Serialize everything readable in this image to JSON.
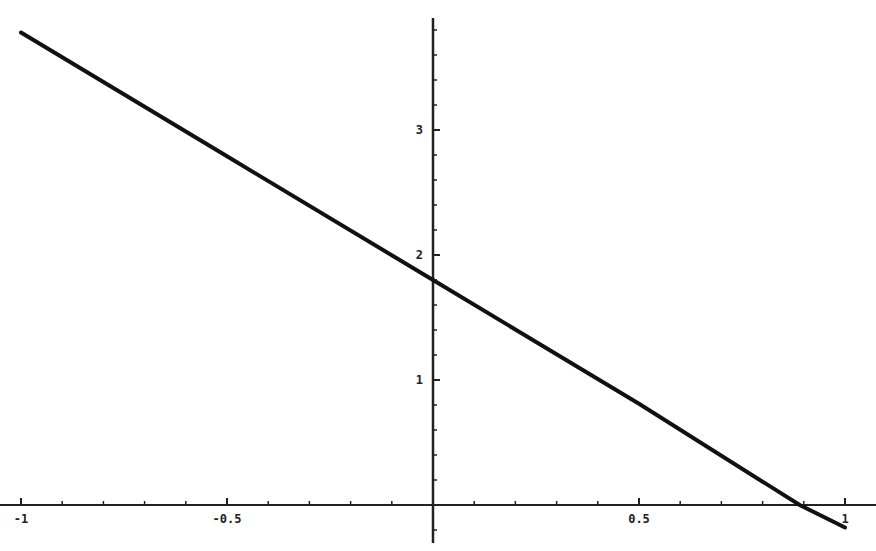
{
  "chart_data": {
    "type": "line",
    "title": "",
    "xlabel": "",
    "ylabel": "",
    "xlim": [
      -1.03,
      1.07
    ],
    "ylim": [
      -0.3,
      3.9
    ],
    "grid": false,
    "legend": null,
    "x_ticks": [
      -1,
      -0.5,
      0.5,
      1
    ],
    "x_tick_labels": [
      "-1",
      "-0.5",
      "0.5",
      "1"
    ],
    "y_ticks": [
      1,
      2,
      3
    ],
    "y_tick_labels": [
      "1",
      "2",
      "3"
    ],
    "series": [
      {
        "name": "f(x)",
        "x": [
          -1,
          -0.5,
          0,
          0.5,
          0.89,
          1
        ],
        "y": [
          3.78,
          2.79,
          1.8,
          0.81,
          0.0,
          -0.18
        ],
        "color": "#111111"
      }
    ]
  },
  "colors": {
    "line": "#111111",
    "axis": "#222222",
    "background": "#ffffff"
  }
}
